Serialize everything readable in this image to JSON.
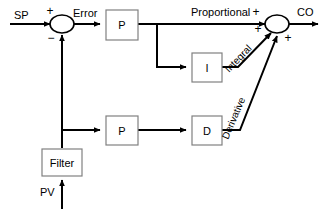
{
  "diagram": {
    "canvas": {
      "width": 326,
      "height": 215,
      "background": "#ffffff"
    },
    "colors": {
      "wire": "#000000",
      "block_border": "#808080",
      "block_fill": "#ffffff",
      "text": "#000000"
    },
    "signals": {
      "setpoint": "SP",
      "error": "Error",
      "process_variable": "PV",
      "controller_output": "CO",
      "proportional": "Proportional",
      "integral": "Integral",
      "derivative": "Derivative"
    },
    "blocks": {
      "proportional_top": "P",
      "integral": "I",
      "proportional_bottom": "P",
      "derivative": "D",
      "filter": "Filter"
    },
    "signs": {
      "sp_plus": "+",
      "pv_minus": "−",
      "proportional_plus": "+",
      "integral_plus": "+",
      "derivative_plus": "+"
    }
  }
}
